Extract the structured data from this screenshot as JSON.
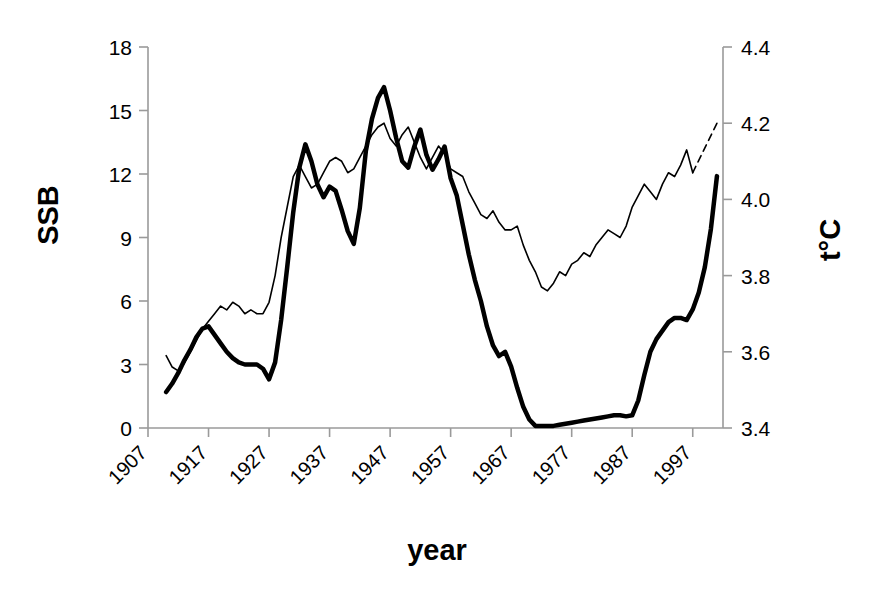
{
  "chart_data": {
    "type": "line",
    "title": "",
    "xlabel": "year",
    "ylabel": "SSB",
    "y2label": "t°C",
    "grid": false,
    "legend": "none",
    "xlim": [
      1907,
      2002
    ],
    "ylim": [
      0,
      18
    ],
    "y2lim": [
      3.4,
      4.4
    ],
    "ytick_labels": [
      "18",
      "15",
      "12",
      "9",
      "6",
      "3",
      "0"
    ],
    "ytick_values": [
      18,
      15,
      12,
      9,
      6,
      3,
      0
    ],
    "y2tick_labels": [
      "4.4",
      "4.2",
      "4.0",
      "3.8",
      "3.6",
      "3.4"
    ],
    "y2tick_values": [
      4.4,
      4.2,
      4.0,
      3.8,
      3.6,
      3.4
    ],
    "xtick_labels": [
      "1907",
      "1917",
      "1927",
      "1937",
      "1947",
      "1957",
      "1967",
      "1977",
      "1987",
      "1997"
    ],
    "xtick_values": [
      1907,
      1917,
      1927,
      1937,
      1947,
      1957,
      1967,
      1977,
      1987,
      1997
    ],
    "series": [
      {
        "name": "SSB",
        "axis": "left",
        "style": "thick-solid",
        "color": "#000000",
        "width": 4.5,
        "x": [
          1910,
          1911,
          1912,
          1913,
          1914,
          1915,
          1916,
          1917,
          1918,
          1919,
          1920,
          1921,
          1922,
          1923,
          1924,
          1925,
          1926,
          1927,
          1928,
          1929,
          1930,
          1931,
          1932,
          1933,
          1934,
          1935,
          1936,
          1937,
          1938,
          1939,
          1940,
          1941,
          1942,
          1943,
          1944,
          1945,
          1946,
          1947,
          1948,
          1949,
          1950,
          1951,
          1952,
          1953,
          1954,
          1955,
          1956,
          1957,
          1958,
          1959,
          1960,
          1961,
          1962,
          1963,
          1964,
          1965,
          1966,
          1967,
          1968,
          1969,
          1970,
          1971,
          1972,
          1973,
          1974,
          1975,
          1976,
          1977,
          1978,
          1979,
          1980,
          1981,
          1982,
          1983,
          1984,
          1985,
          1986,
          1987,
          1988,
          1989,
          1990,
          1991,
          1992,
          1993,
          1994,
          1995,
          1996,
          1997,
          1998,
          1999,
          2000,
          2001
        ],
        "values": [
          1.7,
          2.1,
          2.6,
          3.2,
          3.7,
          4.3,
          4.7,
          4.8,
          4.4,
          4.0,
          3.6,
          3.3,
          3.1,
          3.0,
          3.0,
          3.0,
          2.8,
          2.3,
          3.1,
          5.1,
          7.6,
          10.2,
          12.3,
          13.4,
          12.6,
          11.5,
          10.9,
          11.4,
          11.2,
          10.3,
          9.3,
          8.7,
          10.4,
          13.1,
          14.6,
          15.6,
          16.1,
          15.0,
          13.7,
          12.6,
          12.3,
          13.3,
          14.1,
          12.9,
          12.2,
          12.7,
          13.3,
          11.8,
          11.0,
          9.6,
          8.2,
          7.0,
          6.0,
          4.8,
          3.9,
          3.4,
          3.6,
          2.9,
          1.9,
          1.0,
          0.4,
          0.1,
          0.1,
          0.1,
          0.1,
          0.15,
          0.2,
          0.25,
          0.3,
          0.35,
          0.4,
          0.45,
          0.5,
          0.55,
          0.6,
          0.6,
          0.55,
          0.6,
          1.3,
          2.5,
          3.6,
          4.2,
          4.6,
          5.0,
          5.2,
          5.2,
          5.1,
          5.6,
          6.4,
          7.6,
          9.4,
          11.9
        ]
      },
      {
        "name": "t°C",
        "axis": "right",
        "style": "thin-solid",
        "color": "#000000",
        "width": 1.6,
        "x": [
          1910,
          1911,
          1912,
          1913,
          1914,
          1915,
          1916,
          1917,
          1918,
          1919,
          1920,
          1921,
          1922,
          1923,
          1924,
          1925,
          1926,
          1927,
          1928,
          1929,
          1930,
          1931,
          1932,
          1933,
          1934,
          1935,
          1936,
          1937,
          1938,
          1939,
          1940,
          1941,
          1942,
          1943,
          1944,
          1945,
          1946,
          1947,
          1948,
          1949,
          1950,
          1951,
          1952,
          1953,
          1954,
          1955,
          1956,
          1957,
          1958,
          1959,
          1960,
          1961,
          1962,
          1963,
          1964,
          1965,
          1966,
          1967,
          1968,
          1969,
          1970,
          1971,
          1972,
          1973,
          1974,
          1975,
          1976,
          1977,
          1978,
          1979,
          1980,
          1981,
          1982,
          1983,
          1984,
          1985,
          1986,
          1987,
          1988,
          1989,
          1990,
          1991,
          1992,
          1993,
          1994,
          1995,
          1996,
          1997
        ],
        "values": [
          3.59,
          3.56,
          3.55,
          3.57,
          3.6,
          3.63,
          3.66,
          3.68,
          3.7,
          3.72,
          3.71,
          3.73,
          3.72,
          3.7,
          3.71,
          3.7,
          3.7,
          3.73,
          3.8,
          3.9,
          3.98,
          4.06,
          4.09,
          4.06,
          4.03,
          4.04,
          4.07,
          4.1,
          4.11,
          4.1,
          4.07,
          4.08,
          4.11,
          4.14,
          4.17,
          4.19,
          4.2,
          4.16,
          4.14,
          4.17,
          4.19,
          4.15,
          4.11,
          4.08,
          4.11,
          4.14,
          4.12,
          4.08,
          4.07,
          4.06,
          4.02,
          3.99,
          3.96,
          3.95,
          3.97,
          3.94,
          3.92,
          3.92,
          3.93,
          3.88,
          3.84,
          3.81,
          3.77,
          3.76,
          3.78,
          3.81,
          3.8,
          3.83,
          3.84,
          3.86,
          3.85,
          3.88,
          3.9,
          3.92,
          3.91,
          3.9,
          3.93,
          3.98,
          4.01,
          4.04,
          4.02,
          4.0,
          4.04,
          4.07,
          4.06,
          4.09,
          4.13,
          4.07
        ]
      },
      {
        "name": "t°C-projection",
        "axis": "right",
        "style": "thin-dashed",
        "color": "#000000",
        "width": 1.6,
        "x": [
          1997,
          2001
        ],
        "values": [
          4.07,
          4.2
        ]
      }
    ]
  },
  "axes": {
    "left_title": "SSB",
    "right_title": "t°C",
    "bottom_title": "year"
  }
}
